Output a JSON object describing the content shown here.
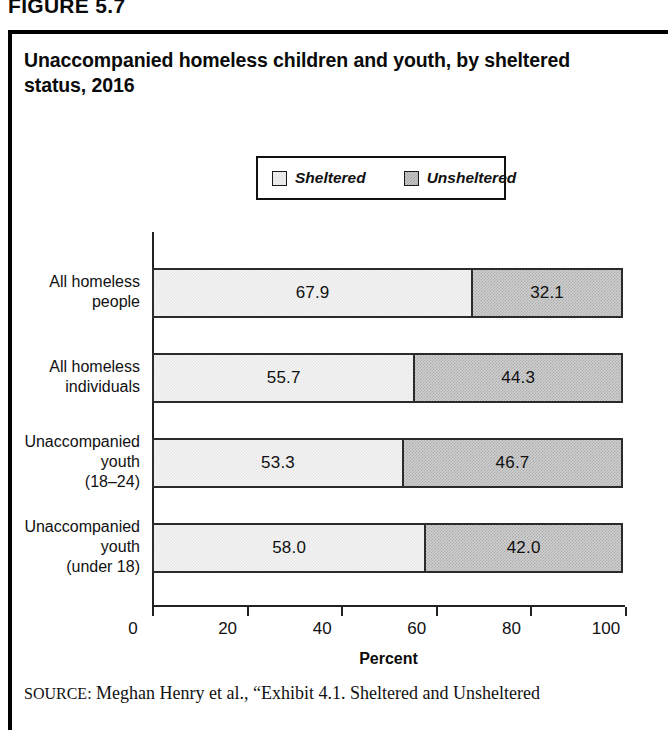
{
  "figure": {
    "number_label": "FIGURE 5.7",
    "title": "Unaccompanied homeless children and youth, by sheltered status, 2016"
  },
  "legend": {
    "entries": [
      {
        "label": "Sheltered",
        "swatch": "light-gray-swatch",
        "color": "#f2f2f2"
      },
      {
        "label": "Unsheltered",
        "swatch": "dark-gray-swatch",
        "color": "#c8c8c8"
      }
    ]
  },
  "source": {
    "label": "SOURCE:",
    "text": "Meghan Henry et al., “Exhibit 4.1. Sheltered and Unsheltered"
  },
  "chart_data": {
    "type": "bar",
    "orientation": "horizontal",
    "stacked": true,
    "stack_total": 100,
    "title": "Unaccompanied homeless children and youth, by sheltered status, 2016",
    "xlabel": "Percent",
    "ylabel": "",
    "xlim": [
      0,
      100
    ],
    "xticks": [
      0,
      20,
      40,
      60,
      80,
      100
    ],
    "xtick_labels": [
      "0",
      "20",
      "40",
      "60",
      "80",
      "100"
    ],
    "grid": false,
    "legend_position": "top-center",
    "categories": [
      "All homeless people",
      "All homeless individuals",
      "Unaccompanied youth (18–24)",
      "Unaccompanied youth (under 18)"
    ],
    "category_lines": [
      [
        "All homeless",
        "people"
      ],
      [
        "All homeless",
        "individuals"
      ],
      [
        "Unaccompanied",
        "youth",
        "(18–24)"
      ],
      [
        "Unaccompanied",
        "youth",
        "(under 18)"
      ]
    ],
    "series": [
      {
        "name": "Sheltered",
        "values": [
          67.9,
          55.7,
          53.3,
          58.0
        ],
        "color": "#f2f2f2"
      },
      {
        "name": "Unsheltered",
        "values": [
          32.1,
          44.3,
          46.7,
          42.0
        ],
        "color": "#c8c8c8"
      }
    ],
    "value_labels": [
      [
        "67.9",
        "32.1"
      ],
      [
        "55.7",
        "44.3"
      ],
      [
        "53.3",
        "46.7"
      ],
      [
        "58.0",
        "42.0"
      ]
    ]
  }
}
